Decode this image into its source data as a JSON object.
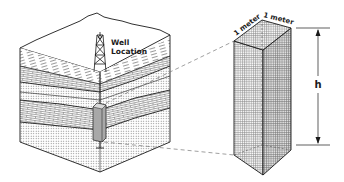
{
  "diagram": {
    "type": "geologic block diagram with unit volume column",
    "labels": {
      "well_line1": "Well",
      "well_line2": "Location",
      "width_label_1": "1 meter",
      "width_label_2": "1 meter",
      "height_label": "h"
    },
    "components": [
      "terrain-surface",
      "layered-rock-block",
      "drill-rig-tower",
      "well-bore",
      "sampled-column",
      "unit-prism",
      "height-dimension-arrow"
    ],
    "colors": {
      "line": "#1a1a1a",
      "stipple": "#8a8a8a",
      "column_fill": "#9a9a9a",
      "background": "#ffffff"
    }
  }
}
